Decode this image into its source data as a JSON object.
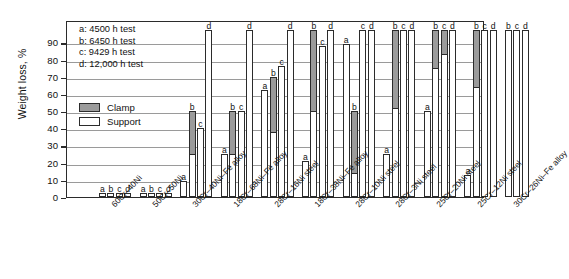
{
  "chart_data": {
    "type": "bar",
    "title": "",
    "xlabel": "",
    "ylabel": "Weight loss, %",
    "ylim": [
      0,
      103
    ],
    "yticks": [
      0,
      10,
      20,
      30,
      40,
      50,
      60,
      70,
      80,
      90
    ],
    "grid": true,
    "legend_position": "inside-upper-left",
    "test_key": [
      "a: 4500 h test",
      "b: 6450 h test",
      "c: 9429 h test",
      "d: 12,000 h test"
    ],
    "series_key": [
      {
        "name": "Clamp",
        "color": "#9b9b9b"
      },
      {
        "name": "Support",
        "color": "#ffffff"
      }
    ],
    "categories": [
      "60Cr–40Ni",
      "50Cr–50Ni",
      "30Cr–40Ni–Fe alloy",
      "18Cr–68Ni–Fe alloy",
      "28Cr–16Ni steel",
      "18Cr–38Ni–Fe alloy",
      "28Cr–10Ni steel",
      "28Cr–3Ni steel",
      "25Cr–20Ni steel",
      "25Cr–12Ni steel",
      "30Cr–26Ni–Fe alloy"
    ],
    "groups": [
      {
        "category": "60Cr–40Ni",
        "bars": [
          {
            "label": "a",
            "total": 2.2,
            "support": 2.2,
            "clamp": 0
          },
          {
            "label": "b",
            "total": 2.2,
            "support": 2.2,
            "clamp": 0
          },
          {
            "label": "c",
            "total": 2.2,
            "support": 2.2,
            "clamp": 0
          },
          {
            "label": "d",
            "total": 2.2,
            "support": 2.2,
            "clamp": 0
          }
        ]
      },
      {
        "category": "50Cr–50Ni",
        "bars": [
          {
            "label": "a",
            "total": 2.2,
            "support": 2.2,
            "clamp": 0
          },
          {
            "label": "b",
            "total": 2.2,
            "support": 2.2,
            "clamp": 0
          },
          {
            "label": "c",
            "total": 2.2,
            "support": 2.2,
            "clamp": 0
          },
          {
            "label": "d",
            "total": 2.2,
            "support": 2.2,
            "clamp": 0
          }
        ]
      },
      {
        "category": "30Cr–40Ni–Fe alloy",
        "bars": [
          {
            "label": "a",
            "total": 9.5,
            "support": 9.5,
            "clamp": 0
          },
          {
            "label": "b",
            "total": 50,
            "support": 25,
            "clamp": 25
          },
          {
            "label": "c",
            "total": 40,
            "support": 40,
            "clamp": 0
          },
          {
            "label": "d",
            "total": 97,
            "support": 97,
            "clamp": 0
          }
        ]
      },
      {
        "category": "18Cr–68Ni–Fe alloy",
        "bars": [
          {
            "label": "a",
            "total": 25,
            "support": 25,
            "clamp": 0
          },
          {
            "label": "b",
            "total": 50,
            "support": 25,
            "clamp": 25
          },
          {
            "label": "c",
            "total": 50,
            "support": 50,
            "clamp": 0
          },
          {
            "label": "d",
            "total": 97,
            "support": 97,
            "clamp": 0
          }
        ]
      },
      {
        "category": "28Cr–16Ni steel",
        "bars": [
          {
            "label": "a",
            "total": 62,
            "support": 62,
            "clamp": 0
          },
          {
            "label": "b",
            "total": 70,
            "support": 38,
            "clamp": 32
          },
          {
            "label": "c",
            "total": 76,
            "support": 76,
            "clamp": 0
          },
          {
            "label": "d",
            "total": 97,
            "support": 97,
            "clamp": 0
          }
        ]
      },
      {
        "category": "18Cr–38Ni–Fe alloy",
        "bars": [
          {
            "label": "a",
            "total": 21,
            "support": 21,
            "clamp": 0
          },
          {
            "label": "b",
            "total": 97,
            "support": 50,
            "clamp": 47
          },
          {
            "label": "c",
            "total": 88,
            "support": 88,
            "clamp": 0
          },
          {
            "label": "d",
            "total": 97,
            "support": 97,
            "clamp": 0
          }
        ]
      },
      {
        "category": "28Cr–10Ni steel",
        "bars": [
          {
            "label": "a",
            "total": 89,
            "support": 89,
            "clamp": 0
          },
          {
            "label": "b",
            "total": 50,
            "support": 14,
            "clamp": 36
          },
          {
            "label": "c",
            "total": 97,
            "support": 97,
            "clamp": 0
          },
          {
            "label": "d",
            "total": 97,
            "support": 97,
            "clamp": 0
          }
        ]
      },
      {
        "category": "28Cr–3Ni steel",
        "bars": [
          {
            "label": "a",
            "total": 25,
            "support": 25,
            "clamp": 0
          },
          {
            "label": "b",
            "total": 97,
            "support": 52,
            "clamp": 45
          },
          {
            "label": "c",
            "total": 97,
            "support": 97,
            "clamp": 0
          },
          {
            "label": "d",
            "total": 97,
            "support": 97,
            "clamp": 0
          }
        ]
      },
      {
        "category": "25Cr–20Ni steel",
        "bars": [
          {
            "label": "a",
            "total": 50,
            "support": 50,
            "clamp": 0
          },
          {
            "label": "b",
            "total": 97,
            "support": 75,
            "clamp": 22
          },
          {
            "label": "c",
            "total": 97,
            "support": 83,
            "clamp": 14
          },
          {
            "label": "d",
            "total": 97,
            "support": 97,
            "clamp": 0
          }
        ]
      },
      {
        "category": "25Cr–12Ni steel",
        "bars": [
          {
            "label": "a",
            "total": 13,
            "support": 13,
            "clamp": 0
          },
          {
            "label": "b",
            "total": 97,
            "support": 64,
            "clamp": 33
          },
          {
            "label": "c",
            "total": 97,
            "support": 97,
            "clamp": 0
          },
          {
            "label": "d",
            "total": 97,
            "support": 97,
            "clamp": 0
          }
        ]
      },
      {
        "category": "30Cr–26Ni–Fe alloy",
        "bars": [
          {
            "label": "b",
            "total": 97,
            "support": 97,
            "clamp": 0
          },
          {
            "label": "c",
            "total": 97,
            "support": 97,
            "clamp": 0
          },
          {
            "label": "d",
            "total": 97,
            "support": 97,
            "clamp": 0
          }
        ]
      }
    ]
  },
  "axis": {
    "ylabel": "Weight loss, %"
  }
}
